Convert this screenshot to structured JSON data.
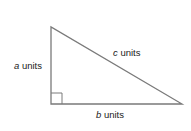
{
  "diagram": {
    "type": "right-triangle",
    "vertices": {
      "top": [
        51,
        27
      ],
      "right_angle": [
        51,
        104
      ],
      "right": [
        182,
        104
      ]
    },
    "right_angle_marker_size": 11,
    "stroke_color": "#7a7a7a",
    "labels": {
      "a": {
        "var": "a",
        "text": " units"
      },
      "b": {
        "var": "b",
        "text": " units"
      },
      "c": {
        "var": "c",
        "text": " units"
      }
    }
  }
}
